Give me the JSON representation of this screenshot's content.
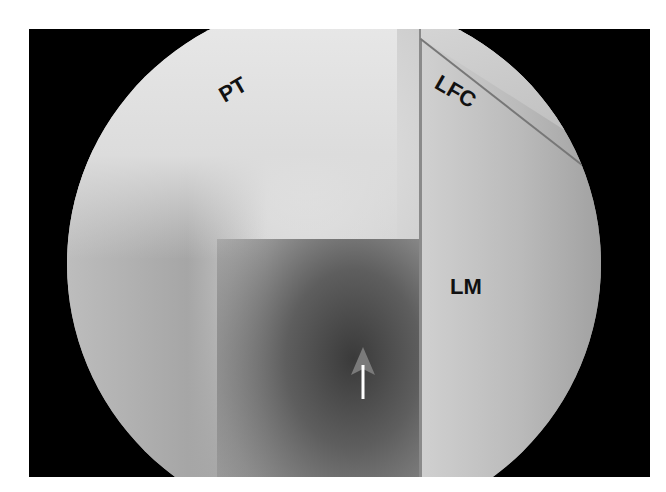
{
  "image": {
    "type": "arthroscopic view",
    "labels": {
      "pt": "PT",
      "lfc": "LFC",
      "lm": "LM"
    },
    "arrow": {
      "description": "white arrow pointing up",
      "color": "#ffffff",
      "head_color": "#7a7a7a"
    }
  },
  "colors": {
    "frame": "#000000",
    "background": "#ffffff"
  }
}
